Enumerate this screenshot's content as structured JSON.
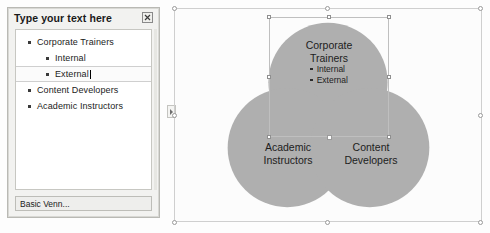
{
  "text_pane": {
    "title": "Type your text here",
    "close_icon": "close-icon",
    "footer_label": "Basic Venn...",
    "items": [
      {
        "label": "Corporate Trainers",
        "level": 1,
        "active": false
      },
      {
        "label": "Internal",
        "level": 2,
        "active": false
      },
      {
        "label": "External",
        "level": 2,
        "active": true
      },
      {
        "label": "Content Developers",
        "level": 1,
        "active": false
      },
      {
        "label": "Academic Instructors",
        "level": 1,
        "active": false
      }
    ]
  },
  "diagram": {
    "type": "venn",
    "layout_name": "Basic Venn",
    "circle_fill": "#a8a8a8",
    "circle_overlap_fill": "#8e8e8e",
    "circles": [
      {
        "name": "top",
        "title": "Corporate Trainers",
        "title_lines": [
          "Corporate",
          "Trainers"
        ],
        "sub_items": [
          "Internal",
          "External"
        ],
        "selected": true
      },
      {
        "name": "bottom-left",
        "title": "Academic Instructors",
        "title_lines": [
          "Academic",
          "Instructors"
        ],
        "sub_items": [],
        "selected": false
      },
      {
        "name": "bottom-right",
        "title": "Content Developers",
        "title_lines": [
          "Content",
          "Developers"
        ],
        "sub_items": [],
        "selected": false
      }
    ]
  },
  "canvas": {
    "pane_toggle_icon": "chevron-right-icon"
  }
}
